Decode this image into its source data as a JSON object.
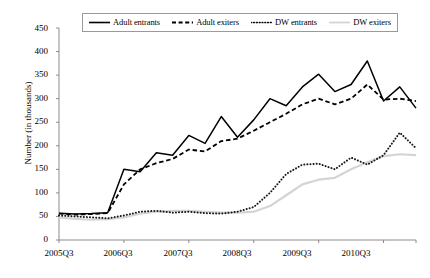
{
  "chart_data": {
    "type": "line",
    "title": "",
    "xlabel": "",
    "ylabel": "Number (in thousands)",
    "ylim": [
      0,
      450
    ],
    "ytick_step": 50,
    "yticks": [
      0,
      50,
      100,
      150,
      200,
      250,
      300,
      350,
      400,
      450
    ],
    "grid": false,
    "legend_position": "top",
    "x": [
      "2005Q3",
      "2005Q4",
      "2006Q1",
      "2006Q2",
      "2006Q3",
      "2006Q4",
      "2007Q1",
      "2007Q2",
      "2007Q3",
      "2007Q4",
      "2008Q1",
      "2008Q2",
      "2008Q3",
      "2008Q4",
      "2009Q1",
      "2009Q2",
      "2009Q3",
      "2009Q4",
      "2010Q1",
      "2010Q2",
      "2010Q3",
      "2010Q4",
      "2011Q1"
    ],
    "xticks": [
      "2005Q3",
      "2006Q3",
      "2007Q3",
      "2008Q3",
      "2009Q3",
      "2010Q3"
    ],
    "series": [
      {
        "name": "Adult entrants",
        "style": "solid",
        "color": "#000000",
        "values": [
          57,
          55,
          56,
          58,
          150,
          145,
          185,
          180,
          222,
          205,
          262,
          218,
          255,
          300,
          285,
          325,
          352,
          315,
          330,
          380,
          295,
          325,
          280
        ]
      },
      {
        "name": "Adult exiters",
        "style": "dashed",
        "color": "#000000",
        "values": [
          56,
          54,
          55,
          57,
          118,
          150,
          163,
          172,
          192,
          188,
          210,
          215,
          232,
          250,
          268,
          288,
          300,
          288,
          300,
          330,
          298,
          300,
          295
        ]
      },
      {
        "name": "DW entrants",
        "style": "dotted",
        "color": "#1a1a1a",
        "values": [
          52,
          50,
          48,
          46,
          52,
          60,
          62,
          58,
          60,
          57,
          56,
          60,
          70,
          100,
          140,
          160,
          162,
          150,
          175,
          160,
          180,
          228,
          195
        ]
      },
      {
        "name": "DW exiters",
        "style": "solid-light",
        "color": "#d4d4d4",
        "values": [
          48,
          45,
          43,
          44,
          48,
          56,
          60,
          62,
          62,
          60,
          58,
          58,
          60,
          72,
          95,
          118,
          128,
          132,
          150,
          165,
          178,
          182,
          180
        ]
      }
    ]
  },
  "legend": {
    "items": [
      {
        "label": "Adult entrants",
        "swatch": "solid-line-swatch"
      },
      {
        "label": "Adult exiters",
        "swatch": "dashed-line-swatch"
      },
      {
        "label": "DW entrants",
        "swatch": "dotted-line-swatch"
      },
      {
        "label": "DW exiters",
        "swatch": "light-solid-line-swatch"
      }
    ]
  },
  "axes": {
    "y_title": "Number (in thousands)",
    "y_labels": [
      "450",
      "400",
      "350",
      "300",
      "250",
      "200",
      "150",
      "100",
      "50",
      "0"
    ],
    "x_labels": [
      "2005Q3",
      "2006Q3",
      "2007Q3",
      "2008Q3",
      "2009Q3",
      "2010Q3"
    ]
  },
  "colors": {
    "axis": "#8c8c8c",
    "series_dark": "#000000",
    "series_light": "#d4d4d4",
    "legend_border": "#9a9a9a"
  }
}
